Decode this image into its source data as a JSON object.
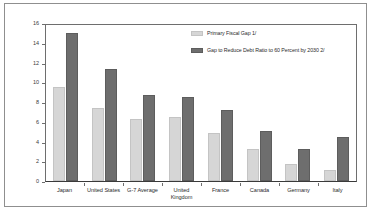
{
  "chart_data": {
    "type": "bar",
    "title": "",
    "subtitle": "",
    "xlabel": "",
    "ylabel": "",
    "ylim": [
      0,
      16
    ],
    "yticks": [
      0,
      2,
      4,
      6,
      8,
      10,
      12,
      14,
      16
    ],
    "ytick_labels": [
      "0",
      "2",
      "4",
      "6",
      "8",
      "10",
      "12",
      "14",
      "16"
    ],
    "grid": false,
    "legend_position": "top-right",
    "categories": [
      "Japan",
      "United States",
      "G-7 Average",
      "United Kingdom",
      "France",
      "Canada",
      "Germany",
      "Italy"
    ],
    "series": [
      {
        "name": "Primary Fiscal Gap 1/",
        "color": "#d6d6d6",
        "values": [
          9.5,
          7.4,
          6.3,
          6.5,
          4.9,
          3.2,
          1.7,
          1.1
        ]
      },
      {
        "name": "Gap to Reduce Debt Ratio to 60 Percent by 2030 2/",
        "color": "#6e6e6e",
        "values": [
          15.0,
          11.3,
          8.7,
          8.5,
          7.2,
          5.1,
          3.2,
          4.5
        ]
      }
    ]
  },
  "legend": {
    "entries": [
      {
        "label": "Primary Fiscal Gap 1/",
        "swatch": "light-gray-swatch"
      },
      {
        "label": "Gap to Reduce Debt Ratio to 60 Percent by 2030 2/",
        "swatch": "dark-gray-swatch"
      }
    ]
  }
}
